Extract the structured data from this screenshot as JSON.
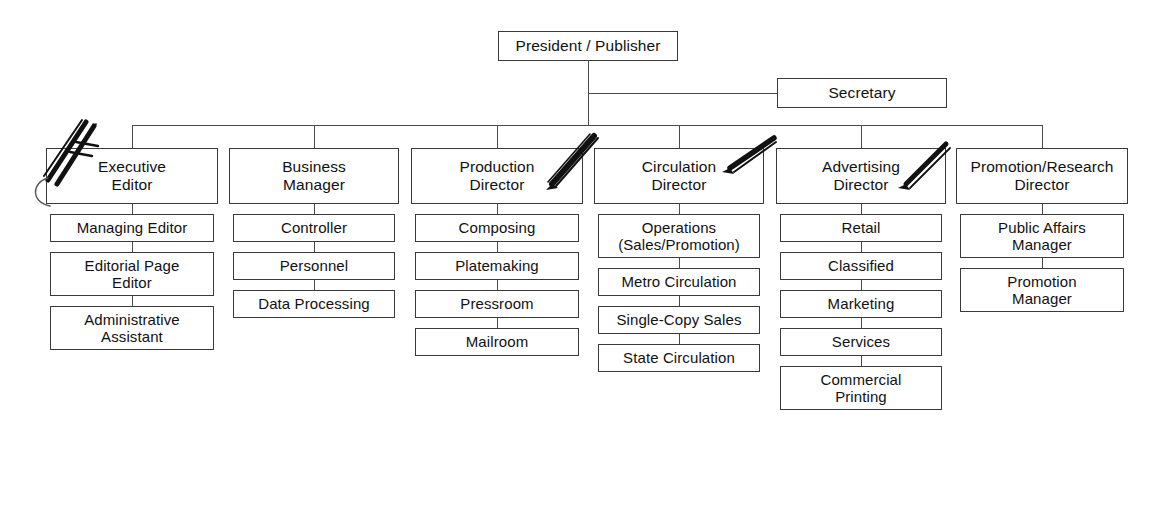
{
  "chart": {
    "type": "org-chart",
    "root": {
      "label": "President / Publisher"
    },
    "aide": {
      "label": "Secretary"
    },
    "columns": [
      {
        "head": "Executive\nEditor",
        "children": [
          "Managing Editor",
          "Editorial Page\nEditor",
          "Administrative\nAssistant"
        ]
      },
      {
        "head": "Business\nManager",
        "children": [
          "Controller",
          "Personnel",
          "Data Processing"
        ]
      },
      {
        "head": "Production\nDirector",
        "children": [
          "Composing",
          "Platemaking",
          "Pressroom",
          "Mailroom"
        ]
      },
      {
        "head": "Circulation\nDirector",
        "children": [
          "Operations\n(Sales/Promotion)",
          "Metro Circulation",
          "Single-Copy Sales",
          "State Circulation"
        ]
      },
      {
        "head": "Advertising\nDirector",
        "children": [
          "Retail",
          "Classified",
          "Marketing",
          "Services",
          "Commercial\nPrinting"
        ]
      },
      {
        "head": "Promotion/Research\nDirector",
        "children": [
          "Public Affairs\nManager",
          "Promotion\nManager"
        ]
      }
    ],
    "annotations": [
      {
        "name": "pen-mark-executive-editor"
      },
      {
        "name": "pen-mark-production-director"
      },
      {
        "name": "pen-mark-circulation-director"
      },
      {
        "name": "pen-mark-advertising-director"
      }
    ],
    "colors": {
      "box_border": "#3a3a3a",
      "connector": "#4a4a4a",
      "text": "#111111",
      "background": "#ffffff",
      "annotation": "#111111"
    }
  }
}
